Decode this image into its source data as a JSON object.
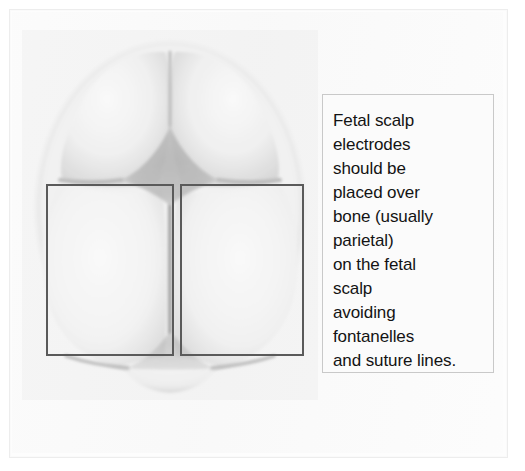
{
  "figure": {
    "illustration_name": "fetal-skull-vertex-view"
  },
  "caption": {
    "lines": [
      "Fetal scalp",
      "electrodes",
      "should be",
      "placed over",
      "bone (usually",
      "parietal)",
      "on the fetal",
      "scalp",
      "avoiding",
      "fontanelles",
      "and suture lines."
    ],
    "full_text": "Fetal scalp electrodes should be placed over bone (usually parietal) on the fetal scalp avoiding fontanelles and suture lines."
  },
  "bleed_through": {
    "line1": "NEVER",
    "line2": "PLACE"
  },
  "skull": {
    "parts": [
      {
        "name": "frontal-bone-left",
        "label": "Frontal bone (left)"
      },
      {
        "name": "frontal-bone-right",
        "label": "Frontal bone (right)"
      },
      {
        "name": "parietal-bone-left",
        "label": "Parietal bone (left)"
      },
      {
        "name": "parietal-bone-right",
        "label": "Parietal bone (right)"
      },
      {
        "name": "occipital-bone",
        "label": "Occipital bone"
      },
      {
        "name": "anterior-fontanelle",
        "label": "Anterior fontanelle"
      },
      {
        "name": "posterior-fontanelle",
        "label": "Posterior fontanelle"
      },
      {
        "name": "sagittal-suture",
        "label": "Sagittal suture"
      },
      {
        "name": "coronal-suture",
        "label": "Coronal suture"
      },
      {
        "name": "frontal-suture",
        "label": "Frontal suture"
      },
      {
        "name": "lambdoid-suture",
        "label": "Lambdoid suture"
      }
    ]
  },
  "markers": {
    "left_box_label": "Left parietal placement region",
    "right_box_label": "Right parietal placement region"
  },
  "colors": {
    "page_background": "#ffffff",
    "panel_background": "#fbfbfb",
    "frame_border": "#ededed",
    "caption_border": "#c9c9c9",
    "caption_text": "#131313",
    "marker_rectangle": "#5a5a5a",
    "bone_light": "#f4f4f4",
    "bone_shadow": "#dcdcdc",
    "fontanelle_gray": "#b9b9b9",
    "suture_line": "#bdbdbd"
  }
}
